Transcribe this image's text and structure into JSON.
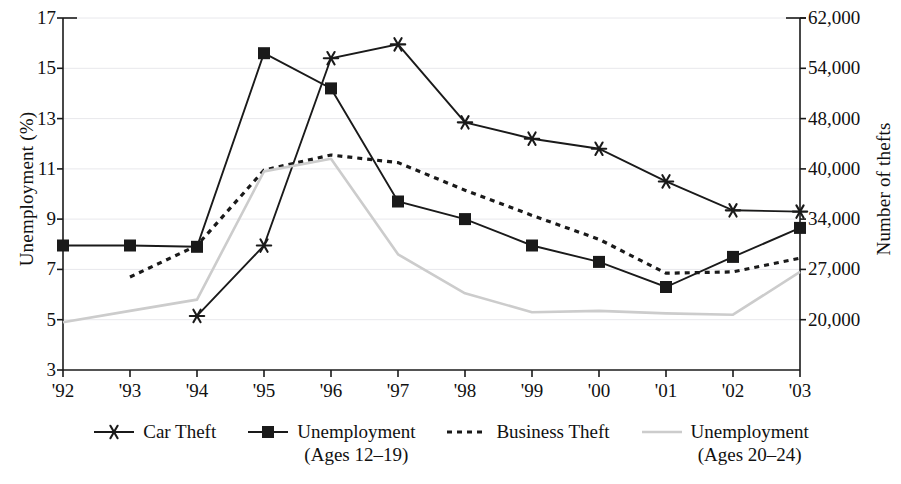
{
  "chart_data": {
    "type": "line",
    "title": "",
    "xlabel": "",
    "ylabel": "Unemployment (%)",
    "ylabel_right": "Number of thefts",
    "x": [
      "'92",
      "'93",
      "'94",
      "'95",
      "'96",
      "'97",
      "'98",
      "'99",
      "'00",
      "'01",
      "'02",
      "'03"
    ],
    "categories": [
      "'92",
      "'93",
      "'94",
      "'95",
      "'96",
      "'97",
      "'98",
      "'99",
      "'00",
      "'01",
      "'02",
      "'03"
    ],
    "ylim": [
      3,
      17
    ],
    "yticks": [
      3,
      5,
      7,
      9,
      11,
      13,
      15,
      17
    ],
    "ytick_labels": [
      "3",
      "5",
      "7",
      "9",
      "11",
      "13",
      "15",
      "17"
    ],
    "yticks_right_labels": [
      "20,000",
      "27,000",
      "34,000",
      "40,000",
      "48,000",
      "54,000",
      "62,000"
    ],
    "yticks_right_at": [
      5,
      7,
      9,
      11,
      13,
      15,
      17
    ],
    "grid": true,
    "grid_axis": "y",
    "legend_position": "bottom",
    "series": [
      {
        "name": "Car Theft",
        "marker": "star",
        "style": "solid",
        "color": "#1a1a1a",
        "axis": "right",
        "values": [
          null,
          null,
          5.15,
          7.95,
          15.4,
          15.95,
          12.85,
          12.2,
          11.8,
          10.5,
          9.35,
          9.3
        ],
        "values_thefts": [
          null,
          null,
          20600,
          31400,
          55600,
          57400,
          47500,
          45400,
          44200,
          40000,
          35500,
          35400
        ]
      },
      {
        "name": "Unemployment (Ages 12–19)",
        "marker": "square",
        "style": "solid",
        "color": "#1a1a1a",
        "axis": "left",
        "values": [
          7.95,
          7.95,
          7.9,
          15.6,
          14.2,
          9.7,
          9.0,
          7.95,
          7.3,
          6.3,
          7.5,
          8.65
        ]
      },
      {
        "name": "Business Theft",
        "marker": "none",
        "style": "dashed",
        "color": "#1a1a1a",
        "axis": "right",
        "values": [
          null,
          6.7,
          7.95,
          10.95,
          11.55,
          11.25,
          10.15,
          9.15,
          8.2,
          6.85,
          6.9,
          7.45
        ],
        "values_thefts": [
          null,
          26300,
          31400,
          39700,
          42200,
          41000,
          37000,
          33800,
          30700,
          26800,
          26900,
          28400
        ]
      },
      {
        "name": "Unemployment (Ages 20–24)",
        "marker": "none",
        "style": "thin-solid",
        "color": "#cccccc",
        "axis": "left",
        "values": [
          4.9,
          5.35,
          5.8,
          10.9,
          11.4,
          7.6,
          6.05,
          5.3,
          5.35,
          5.25,
          5.2,
          6.9
        ]
      }
    ]
  },
  "axes": {
    "left_title": "Unemployment (%)",
    "right_title": "Number of thefts",
    "left_ticks": [
      "17",
      "15",
      "13",
      "11",
      "9",
      "7",
      "5",
      "3"
    ],
    "right_ticks": [
      "62,000",
      "54,000",
      "48,000",
      "40,000",
      "34,000",
      "27,000",
      "20,000"
    ],
    "x_ticks": [
      "'92",
      "'93",
      "'94",
      "'95",
      "'96",
      "'97",
      "'98",
      "'99",
      "'00",
      "'01",
      "'02",
      "'03"
    ]
  },
  "legend": {
    "items": [
      {
        "label_line1": "Car Theft",
        "label_line2": "",
        "icon": "star-marker-line-swatch"
      },
      {
        "label_line1": "Unemployment",
        "label_line2": "(Ages 12–19)",
        "icon": "square-marker-line-swatch"
      },
      {
        "label_line1": "Business Theft",
        "label_line2": "",
        "icon": "dashed-line-swatch"
      },
      {
        "label_line1": "Unemployment",
        "label_line2": "(Ages 20–24)",
        "icon": "gray-line-swatch"
      }
    ]
  },
  "colors": {
    "ink": "#1a1a1a",
    "gray_series": "#cccccc",
    "gridline": "#e8e8ec",
    "background": "#ffffff"
  }
}
